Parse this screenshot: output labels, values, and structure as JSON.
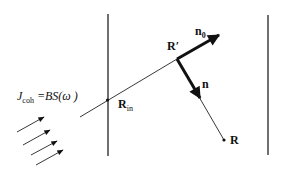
{
  "diagram": {
    "type": "geometric-physics-schematic",
    "colors": {
      "ink": "#111111",
      "background": "#ffffff"
    },
    "labels": {
      "r_prime": "R′",
      "n0_main": "n",
      "n0_sub": "0",
      "n": "n",
      "r_in_main": "R",
      "r_in_sub": "in",
      "r": "R",
      "formula_symbol": "ȷ",
      "formula_symbol_display": "J",
      "formula_sub": "coh",
      "formula_rhs": "=BS(ω )"
    },
    "elements": {
      "left_boundary": {
        "x": 108,
        "y1": 14,
        "y2": 156
      },
      "right_boundary": {
        "x": 268,
        "y1": 15,
        "y2": 155
      },
      "incident_ray": {
        "x1": 80,
        "y1": 117,
        "x2": 177,
        "y2": 59
      },
      "entry_point": {
        "x": 107,
        "y": 100
      },
      "n0_arrow": {
        "x1": 177,
        "y1": 59,
        "x2": 220,
        "y2": 34
      },
      "n_arrow": {
        "x1": 177,
        "y1": 59,
        "x2": 201,
        "y2": 100
      },
      "scatter_ray": {
        "x1": 197,
        "y1": 93,
        "x2": 224,
        "y2": 140
      },
      "observation_point": {
        "x": 224,
        "y": 140
      },
      "incoming_flux_arrows": [
        {
          "x1": 17,
          "y1": 132,
          "x2": 44,
          "y2": 117
        },
        {
          "x1": 23,
          "y1": 145,
          "x2": 50,
          "y2": 130
        },
        {
          "x1": 31,
          "y1": 155,
          "x2": 57,
          "y2": 141
        },
        {
          "x1": 36,
          "y1": 165,
          "x2": 63,
          "y2": 150
        }
      ]
    }
  }
}
